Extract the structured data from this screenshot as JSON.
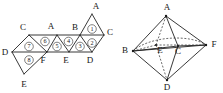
{
  "figure": {
    "background_color": "#ffffff",
    "line_color": "#222222",
    "label_color": "#151515"
  },
  "net": {
    "name": "octahedron-net",
    "description": "Strip of eight equilateral triangles forming the net of an octahedron",
    "vertex_labels": [
      {
        "id": "n-A-top",
        "text": "A",
        "x": 96,
        "y": 7
      },
      {
        "id": "n-C-left",
        "text": "C",
        "x": 23,
        "y": 28
      },
      {
        "id": "n-A-mid",
        "text": "A",
        "x": 50,
        "y": 27
      },
      {
        "id": "n-B",
        "text": "B",
        "x": 74,
        "y": 28
      },
      {
        "id": "n-C-right",
        "text": "C",
        "x": 109,
        "y": 33
      },
      {
        "id": "n-D-left",
        "text": "D",
        "x": 5,
        "y": 54
      },
      {
        "id": "n-F",
        "text": "F",
        "x": 41,
        "y": 62
      },
      {
        "id": "n-E-mid",
        "text": "E",
        "x": 64,
        "y": 61
      },
      {
        "id": "n-D-right",
        "text": "D",
        "x": 88,
        "y": 61
      },
      {
        "id": "n-E-bot",
        "text": "E",
        "x": 24,
        "y": 85
      }
    ],
    "face_labels": [
      {
        "id": "face-1",
        "text": "1",
        "x": 88,
        "y": 27
      },
      {
        "id": "face-2",
        "text": "2",
        "x": 88,
        "y": 44
      },
      {
        "id": "face-3",
        "text": "3",
        "x": 76,
        "y": 50
      },
      {
        "id": "face-4",
        "text": "4",
        "x": 62,
        "y": 42
      },
      {
        "id": "face-5",
        "text": "5",
        "x": 51,
        "y": 50
      },
      {
        "id": "face-6",
        "text": "6",
        "x": 38,
        "y": 41
      },
      {
        "id": "face-7",
        "text": "7",
        "x": 25,
        "y": 48
      },
      {
        "id": "face-8",
        "text": "8",
        "x": 25,
        "y": 63
      }
    ],
    "face_count": 8,
    "vertex_name_set": [
      "A",
      "B",
      "C",
      "D",
      "E",
      "F"
    ]
  },
  "solid": {
    "name": "octahedron",
    "description": "Octahedron drawn in perspective with hidden edges dashed",
    "vertex_labels": [
      {
        "id": "s-A",
        "text": "A",
        "x": 170,
        "y": 8
      },
      {
        "id": "s-B",
        "text": "B",
        "x": 124,
        "y": 50
      },
      {
        "id": "s-E",
        "text": "E",
        "x": 161,
        "y": 48
      },
      {
        "id": "s-C",
        "text": "C",
        "x": 175,
        "y": 49
      },
      {
        "id": "s-F",
        "text": "F",
        "x": 213,
        "y": 45
      },
      {
        "id": "s-D",
        "text": "D",
        "x": 167,
        "y": 87
      }
    ],
    "hidden_vertices": [
      "E",
      "C"
    ],
    "visible_vertices": [
      "A",
      "B",
      "F",
      "D"
    ]
  }
}
